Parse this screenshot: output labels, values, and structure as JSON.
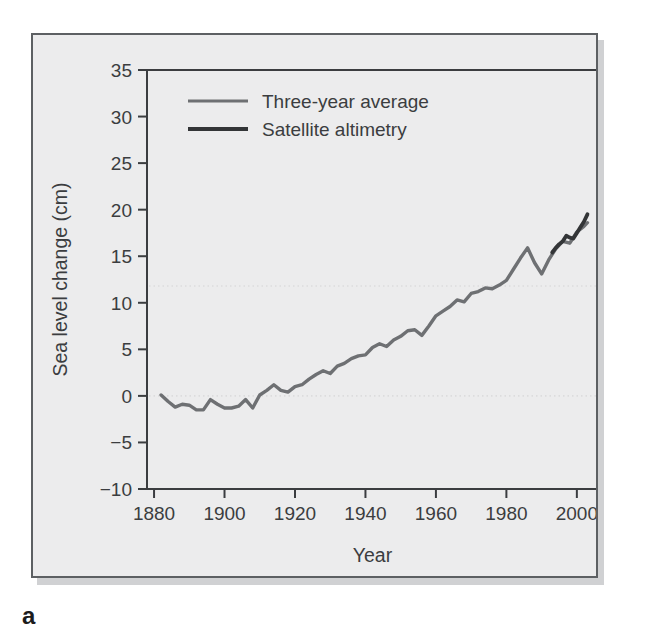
{
  "panel": {
    "label": "a"
  },
  "colors": {
    "figure_background": "#ececed",
    "figure_border": "#5d6063",
    "axis": "#3b3d40",
    "three_year_average": "#6e7073",
    "satellite_altimetry": "#333537",
    "gridline": "#dcdcdd"
  },
  "chart_data": {
    "type": "line",
    "title": "",
    "xlabel": "Year",
    "ylabel": "Sea level change (cm)",
    "xlim": [
      1878,
      2006
    ],
    "ylim": [
      -10,
      35
    ],
    "xticks": [
      1880,
      1900,
      1920,
      1940,
      1960,
      1980,
      2000
    ],
    "xtick_labels": [
      "1880",
      "1900",
      "1920",
      "1940",
      "1960",
      "1980",
      "2000"
    ],
    "yticks": [
      -10,
      -5,
      0,
      5,
      10,
      15,
      20,
      25,
      30,
      35
    ],
    "ytick_labels": [
      "−10",
      "−5",
      "0",
      "5",
      "10",
      "15",
      "20",
      "25",
      "30",
      "35"
    ],
    "grid": false,
    "reference_lines": [
      {
        "y": 0,
        "style": "dotted"
      },
      {
        "y": 11.8,
        "style": "dotted"
      }
    ],
    "legend_position": "top-left",
    "series": [
      {
        "name": "Three-year average",
        "color": "#6e7073",
        "x": [
          1882,
          1884,
          1886,
          1888,
          1890,
          1892,
          1894,
          1896,
          1898,
          1900,
          1902,
          1904,
          1906,
          1908,
          1910,
          1912,
          1914,
          1916,
          1918,
          1920,
          1922,
          1924,
          1926,
          1928,
          1930,
          1932,
          1934,
          1936,
          1938,
          1940,
          1942,
          1944,
          1946,
          1948,
          1950,
          1952,
          1954,
          1956,
          1958,
          1960,
          1962,
          1964,
          1966,
          1968,
          1970,
          1972,
          1974,
          1976,
          1978,
          1980,
          1982,
          1984,
          1986,
          1988,
          1990,
          1992,
          1994,
          1996,
          1998,
          2000,
          2002,
          2003
        ],
        "y": [
          0.1,
          -0.6,
          -1.2,
          -0.9,
          -1.0,
          -1.5,
          -1.5,
          -0.4,
          -0.9,
          -1.3,
          -1.3,
          -1.1,
          -0.4,
          -1.3,
          0.1,
          0.6,
          1.2,
          0.6,
          0.4,
          1.0,
          1.2,
          1.8,
          2.3,
          2.7,
          2.4,
          3.2,
          3.5,
          4.0,
          4.3,
          4.4,
          5.2,
          5.6,
          5.3,
          6.0,
          6.4,
          7.0,
          7.1,
          6.5,
          7.5,
          8.6,
          9.1,
          9.6,
          10.3,
          10.1,
          11.0,
          11.2,
          11.6,
          11.5,
          11.9,
          12.4,
          13.6,
          14.8,
          15.9,
          14.3,
          13.1,
          14.6,
          15.8,
          16.6,
          16.4,
          17.6,
          18.2,
          18.6
        ]
      },
      {
        "name": "Satellite altimetry",
        "color": "#333537",
        "x": [
          1993,
          1994,
          1995,
          1996,
          1997,
          1998,
          1999,
          2000,
          2001,
          2002,
          2003
        ],
        "y": [
          15.4,
          15.9,
          16.3,
          16.6,
          17.2,
          17.0,
          16.9,
          17.5,
          18.1,
          18.7,
          19.5
        ]
      }
    ]
  }
}
